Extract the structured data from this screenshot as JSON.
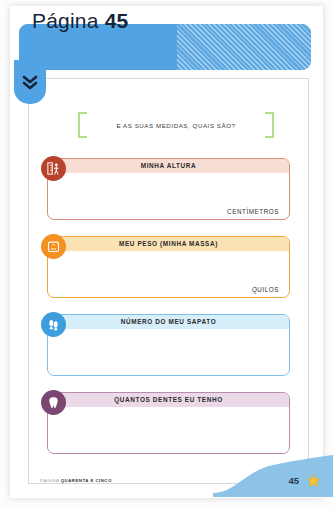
{
  "header": {
    "title_prefix": "Página",
    "page_number": "45",
    "expand_icon": "double-chevron-down-icon",
    "banner_color": "#52a3e4",
    "stripe_color": "#5fa9e3"
  },
  "heading": {
    "text": "E AS SUAS MEDIDAS, QUAIS SÃO?",
    "bracket_color": "#b3dd8c"
  },
  "boxes": [
    {
      "title": "MINHA ALTURA",
      "unit": "CENTÍMETROS",
      "icon": "height-ruler-icon",
      "value": "",
      "accent": "#b8432c",
      "border": "#d98f77",
      "title_bg": "#f7ddd4"
    },
    {
      "title": "MEU PESO (MINHA MASSA)",
      "unit": "QUILOS",
      "icon": "weight-scale-icon",
      "value": "",
      "accent": "#f29021",
      "border": "#eda53c",
      "title_bg": "#fbe2b5"
    },
    {
      "title": "NÚMERO DO MEU SAPATO",
      "unit": "",
      "icon": "footprints-icon",
      "value": "",
      "accent": "#3d9ddd",
      "border": "#7fc0ea",
      "title_bg": "#d7eefb"
    },
    {
      "title": "QUANTOS DENTES EU TENHO",
      "unit": "",
      "icon": "tooth-icon",
      "value": "",
      "accent": "#7c4672",
      "border": "#b98bb0",
      "title_bg": "#ecd9e8"
    }
  ],
  "footer": {
    "note_lead": "PÁGINA",
    "note_bold": "QUARENTA E CINCO",
    "page_number": "45",
    "star_icon": "star-icon",
    "star_color": "#f5c43c",
    "wave_color": "#8ec3e8"
  }
}
